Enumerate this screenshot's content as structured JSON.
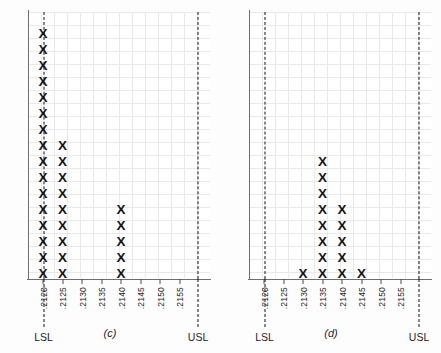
{
  "figure": {
    "background": "#fdfdfd",
    "mark_glyph": "X",
    "mark_color": "#151515",
    "grid_color": "#e9e9ec",
    "axis_color": "#6e6e72"
  },
  "chart_data": [
    {
      "id": "c",
      "type": "bar",
      "subtype": "dot-plot-tally",
      "title": "",
      "caption": "(c)",
      "xlabel": "",
      "ylabel": "",
      "grid": true,
      "legend": "none",
      "categories": [
        ".2120",
        ".2125",
        ".2130",
        ".2135",
        ".2140",
        ".2145",
        ".2150",
        ".2155"
      ],
      "tick_labels": [
        ".2120",
        ".2125",
        ".2130",
        ".2135",
        ".2140",
        ".2145",
        ".2150",
        ".2155"
      ],
      "values": [
        16,
        9,
        0,
        0,
        5,
        0,
        0,
        0
      ],
      "ylim": [
        0,
        17
      ],
      "spec_limits": [
        {
          "name": "LSL",
          "label": "LSL",
          "value": ".2120",
          "style": "dashed"
        },
        {
          "name": "USL",
          "label": "USL",
          "value": ".2160",
          "style": "dashed"
        }
      ]
    },
    {
      "id": "d",
      "type": "bar",
      "subtype": "dot-plot-tally",
      "title": "",
      "caption": "(d)",
      "xlabel": "",
      "ylabel": "",
      "grid": true,
      "legend": "none",
      "categories": [
        ".2120",
        ".2125",
        ".2130",
        ".2135",
        ".2140",
        ".2145",
        ".2150",
        ".2155"
      ],
      "tick_labels": [
        ".2120",
        ".2125",
        ".2130",
        ".2135",
        ".2140",
        ".2145",
        ".2150",
        ".2155"
      ],
      "values": [
        0,
        0,
        1,
        8,
        5,
        1,
        0,
        0
      ],
      "ylim": [
        0,
        17
      ],
      "spec_limits": [
        {
          "name": "LSL",
          "label": "LSL",
          "value": ".2120",
          "style": "dashed"
        },
        {
          "name": "USL",
          "label": "USL",
          "value": ".2160",
          "style": "dashed"
        }
      ]
    }
  ]
}
